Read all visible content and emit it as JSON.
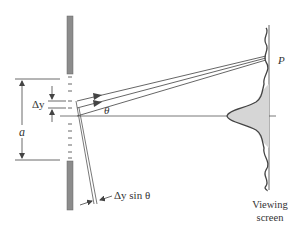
{
  "figure": {
    "type": "single-slit diffraction geometry",
    "labels": {
      "point": "P",
      "delta_y": "Δy",
      "slit_width": "a",
      "angle": "θ",
      "path_difference": "Δy sin θ",
      "screen_line1": "Viewing",
      "screen_line2": "screen"
    },
    "colors": {
      "barrier": "#8c8c8c",
      "line": "#444444",
      "fill": "#d6d6d6",
      "text": "#333333"
    }
  }
}
